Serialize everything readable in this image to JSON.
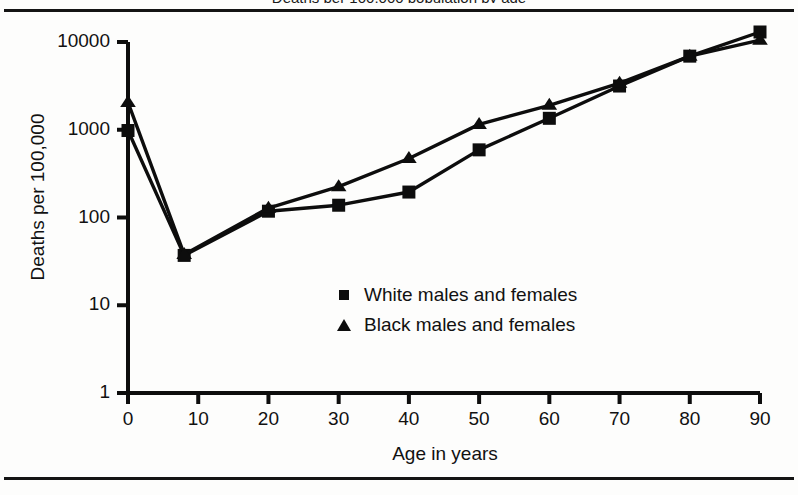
{
  "figure": {
    "title_cut_off": "Deaths per 100,000 population by age",
    "ylabel": "Deaths per 100,000",
    "xlabel": "Age in years"
  },
  "axes": {
    "y_ticks": [
      "10000",
      "1000",
      "100",
      "10",
      "1"
    ],
    "x_ticks": [
      "0",
      "10",
      "20",
      "30",
      "40",
      "50",
      "60",
      "70",
      "80",
      "90"
    ]
  },
  "legend": {
    "items": [
      {
        "marker": "square-marker",
        "label": "White males and females"
      },
      {
        "marker": "triangle-marker",
        "label": "Black males and females"
      }
    ]
  },
  "colors": {
    "ink": "#0d0d0d",
    "paper": "#fdfdfc"
  },
  "chart_data": {
    "type": "line",
    "title": "Deaths per 100,000 population by age",
    "xlabel": "Age in years",
    "ylabel": "Deaths per 100,000",
    "xlim": [
      0,
      90
    ],
    "ylim": [
      1,
      10000
    ],
    "yscale": "log",
    "grid": false,
    "legend_position": "center",
    "x": [
      0,
      8,
      20,
      30,
      40,
      50,
      60,
      70,
      80,
      90
    ],
    "series": [
      {
        "name": "White males and females",
        "marker": "square",
        "values": [
          980,
          37,
          118,
          138,
          195,
          590,
          1350,
          3150,
          6900,
          13000
        ]
      },
      {
        "name": "Black males and females",
        "marker": "triangle",
        "values": [
          2050,
          38,
          128,
          225,
          470,
          1150,
          1900,
          3400,
          6900,
          10500
        ]
      }
    ]
  }
}
